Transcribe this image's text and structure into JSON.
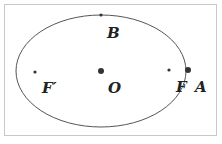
{
  "diagram": {
    "type": "ellipse",
    "labels": {
      "B": "B",
      "F_prime": "F′",
      "O": "O",
      "F": "F",
      "A": "A"
    },
    "colors": {
      "stroke": "#555555",
      "point": "#333333",
      "text": "#222222",
      "border": "#c8c8c8"
    }
  },
  "caption": ""
}
